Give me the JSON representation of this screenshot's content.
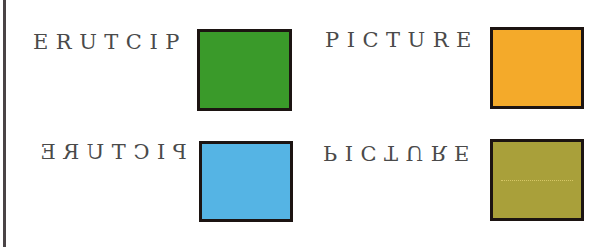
{
  "cells": [
    {
      "id": "top-left",
      "label": "ERUTCIP",
      "transform": "reversed-letter-order",
      "swatch_color": "#3a9a2a"
    },
    {
      "id": "top-right",
      "label": "PICTURE",
      "transform": "normal",
      "swatch_color": "#f4aa2a"
    },
    {
      "id": "bottom-left",
      "label": "PICTURE",
      "transform": "mirrored-horizontally",
      "swatch_color": "#55b4e4"
    },
    {
      "id": "bottom-right",
      "label": "PICTURE",
      "transform": "flipped-vertically",
      "swatch_color": "#a9a03a"
    }
  ]
}
